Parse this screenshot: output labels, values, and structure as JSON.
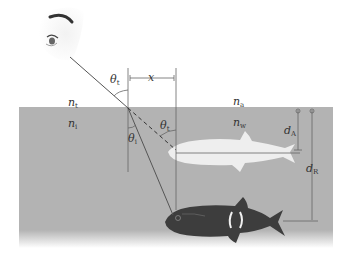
{
  "figure": {
    "colors": {
      "background": "#ffffff",
      "water": "#b3b3b3",
      "lines": "#555555",
      "apparent_fish": "#eeeeee",
      "real_fish": "#3a3a3a"
    },
    "labels": {
      "theta_t_top": {
        "base": "θ",
        "sub": "t"
      },
      "theta_i_bottom": {
        "base": "θ",
        "sub": "i"
      },
      "theta_t_right": {
        "base": "θ",
        "sub": "t"
      },
      "x": {
        "base": "x",
        "sub": ""
      },
      "n_t": {
        "base": "n",
        "sub": "t"
      },
      "n_i": {
        "base": "n",
        "sub": "i"
      },
      "n_a": {
        "base": "n",
        "sub": "a"
      },
      "n_w": {
        "base": "n",
        "sub": "w"
      },
      "d_A": {
        "base": "d",
        "sub": "A"
      },
      "d_R": {
        "base": "d",
        "sub": "R"
      }
    },
    "icons": {
      "eye": "eye-icon",
      "apparent_fish": "apparent-fish-icon",
      "real_fish": "real-fish-icon"
    }
  }
}
